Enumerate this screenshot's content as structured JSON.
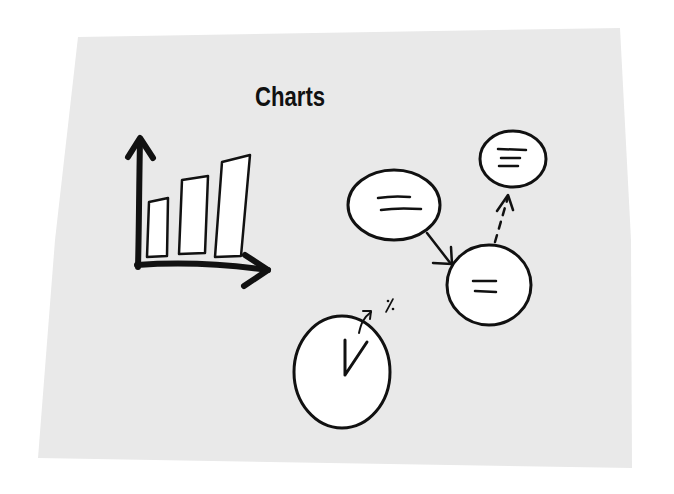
{
  "sketch": {
    "title": "Charts",
    "colors": {
      "background": "#ffffff",
      "paper": "#e9e9e9",
      "ink": "#111111",
      "fill": "#ffffff"
    },
    "elements": {
      "bar_chart": {
        "bars": 3,
        "axes": [
          "y-axis-arrow",
          "x-axis-arrow"
        ]
      },
      "flow_nodes": [
        {
          "id": "node-left",
          "lines": 2
        },
        {
          "id": "node-top-right",
          "lines": 3
        },
        {
          "id": "node-bottom-right",
          "lines": 2
        }
      ],
      "pie_chart": {
        "slices": 2,
        "annotation": "%"
      }
    }
  }
}
